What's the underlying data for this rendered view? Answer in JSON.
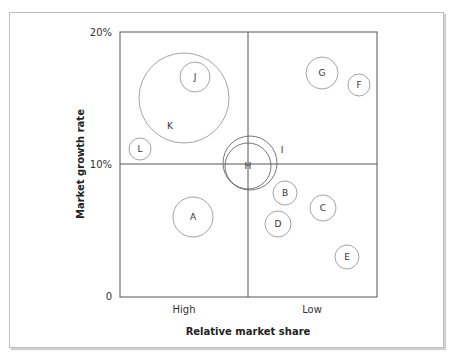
{
  "chart_data": {
    "type": "bubble",
    "title": "",
    "xlabel": "Relative market share",
    "ylabel": "Market growth rate",
    "x_ticks": [
      "High",
      "Low"
    ],
    "y_ticks": [
      "0",
      "10%",
      "20%"
    ],
    "ylim": [
      0,
      20
    ],
    "quadrant_dividers": {
      "x": "mid",
      "y": "10%"
    },
    "grid": false,
    "legend": "none",
    "bubbles": [
      {
        "label": "A",
        "cx": 193,
        "cy": 217,
        "r": 20
      },
      {
        "label": "B",
        "cx": 285,
        "cy": 193,
        "r": 12
      },
      {
        "label": "C",
        "cx": 323,
        "cy": 208,
        "r": 13
      },
      {
        "label": "D",
        "cx": 278,
        "cy": 224,
        "r": 13
      },
      {
        "label": "E",
        "cx": 347,
        "cy": 257,
        "r": 12
      },
      {
        "label": "F",
        "cx": 359,
        "cy": 85,
        "r": 11
      },
      {
        "label": "G",
        "cx": 322,
        "cy": 73,
        "r": 16
      },
      {
        "label": "H",
        "cx": 248,
        "cy": 166,
        "r": 23
      },
      {
        "label": "I",
        "cx": 250,
        "cy": 163,
        "r": 27,
        "label_x": 282,
        "label_y": 150
      },
      {
        "label": "J",
        "cx": 195,
        "cy": 77,
        "r": 15
      },
      {
        "label": "K",
        "cx": 184,
        "cy": 98,
        "r": 45,
        "label_x": 170,
        "label_y": 126
      },
      {
        "label": "L",
        "cx": 140,
        "cy": 149,
        "r": 11
      }
    ]
  }
}
